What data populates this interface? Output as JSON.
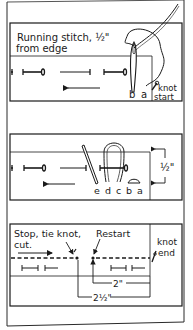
{
  "diagram": {
    "type": "sewing-instruction-illustration",
    "colors": {
      "ink": "#1a1a1a",
      "paper": "#ffffff",
      "frame": "#2a2a2a"
    },
    "panels": [
      {
        "id": "running-stitch",
        "title_line1": "Running stitch, ½\"",
        "title_line2": "from edge",
        "point_labels": [
          "b",
          "a"
        ],
        "knot_label_line1": "knot",
        "knot_label_line2": "start"
      },
      {
        "id": "backstitch-sequence",
        "point_labels": [
          "e",
          "d",
          "c",
          "b",
          "a"
        ],
        "dimension_label": "½\""
      },
      {
        "id": "stop-restart",
        "stop_label_line1": "Stop, tie knot,",
        "stop_label_line2": "cut.",
        "restart_label": "Restart",
        "knot_end_line1": "knot",
        "knot_end_line2": "end",
        "dimension_short": "2\"",
        "dimension_long": "2½\""
      }
    ]
  }
}
